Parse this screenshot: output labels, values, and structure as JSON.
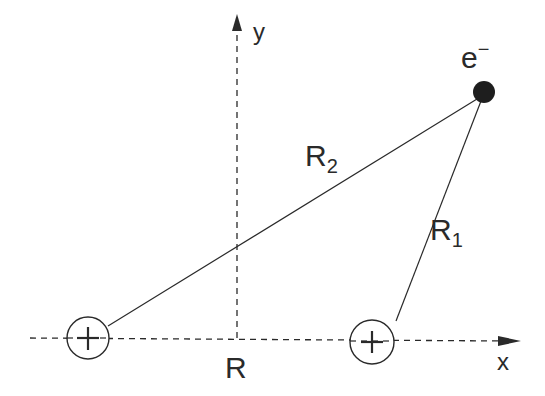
{
  "diagram": {
    "type": "two-center Coulomb geometry",
    "axes": {
      "x_label": "x",
      "y_label": "y",
      "origin_label": "R"
    },
    "particles": {
      "electron": {
        "label": "e",
        "superscript": "−"
      },
      "nucleus_left": {
        "symbol": "+"
      },
      "nucleus_right": {
        "symbol": "+"
      }
    },
    "distances": {
      "r2": {
        "base": "R",
        "sub": "2"
      },
      "r1": {
        "base": "R",
        "sub": "1"
      }
    },
    "colors": {
      "ink": "#2a2a2a",
      "background": "#ffffff"
    }
  }
}
